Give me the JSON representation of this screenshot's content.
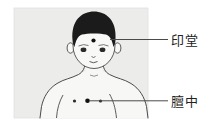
{
  "page": {
    "background": "#ffffff"
  },
  "diagram": {
    "kind": "acupoint-illustration",
    "panel_bg": "#ececea",
    "panel_border": "#e0e0de",
    "outline_color": "#4a4a48",
    "hair_color": "#1b1b1b",
    "feature_color": "#2b2b2b",
    "point_color": "#111111",
    "leader_line_color": "#4a4a4a",
    "label_color": "#222222",
    "labels": [
      {
        "text": "印堂",
        "point": "yintang-point"
      },
      {
        "text": "膻中",
        "point": "danzhong-point"
      }
    ]
  }
}
